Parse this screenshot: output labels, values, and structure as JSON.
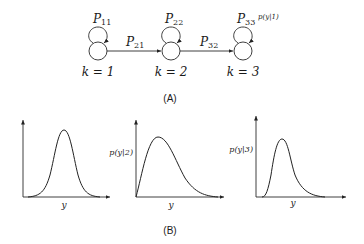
{
  "panel_a": {
    "caption": "(A)",
    "states": [
      {
        "k_label": "k = 1",
        "self_transition": "P",
        "self_sub": "11"
      },
      {
        "k_label": "k = 2",
        "self_transition": "P",
        "self_sub": "22"
      },
      {
        "k_label": "k = 3",
        "self_transition": "P",
        "self_sub": "33"
      }
    ],
    "transitions": [
      {
        "label": "P",
        "sub": "21"
      },
      {
        "label": "P",
        "sub": "32"
      }
    ],
    "emission_label": "p(y|1)"
  },
  "panel_b": {
    "caption": "(B)",
    "plots": [
      {
        "ylabel": "",
        "xlabel": "y"
      },
      {
        "ylabel": "p(y|2)",
        "xlabel": "y"
      },
      {
        "ylabel": "p(y|3)",
        "xlabel": "y"
      }
    ]
  }
}
